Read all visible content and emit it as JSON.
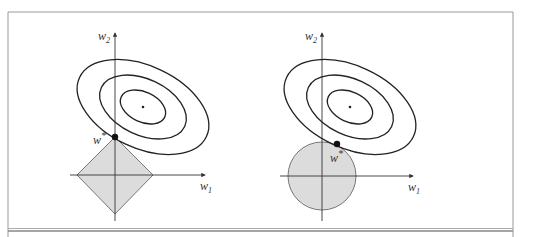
{
  "figure": {
    "colors": {
      "line": "#222222",
      "region_fill": "#dcdcdc",
      "region_stroke": "#777777",
      "frame": "#888888",
      "axis": "#333333"
    },
    "panels": [
      {
        "name": "l1-panel",
        "constraint_shape": "diamond",
        "axis_x_label": "w",
        "axis_x_sub": "1",
        "axis_y_label": "w",
        "axis_y_sub": "2",
        "optimum_label": "w",
        "optimum_sup": "*",
        "contour_count": 3
      },
      {
        "name": "l2-panel",
        "constraint_shape": "circle",
        "axis_x_label": "w",
        "axis_x_sub": "1",
        "axis_y_label": "w",
        "axis_y_sub": "2",
        "optimum_label": "w",
        "optimum_sup": "*",
        "contour_count": 3
      }
    ]
  }
}
